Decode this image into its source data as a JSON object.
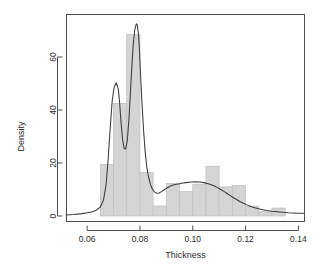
{
  "chart_data": {
    "type": "bar",
    "title": "",
    "subtitle": "",
    "xlabel": "Thickness",
    "ylabel": "Density",
    "xlim": [
      0.052,
      0.1425
    ],
    "ylim": [
      -1,
      75
    ],
    "grid": false,
    "legend": "none",
    "xticks": [
      0.06,
      0.08,
      0.1,
      0.12,
      0.14
    ],
    "xtick_labels": [
      "0.06",
      "0.08",
      "0.10",
      "0.12",
      "0.14"
    ],
    "yticks": [
      0,
      20,
      40,
      60
    ],
    "ytick_labels": [
      "0",
      "20",
      "40",
      "60"
    ],
    "bin_width": 0.005,
    "bin_edges": [
      0.065,
      0.07,
      0.075,
      0.08,
      0.085,
      0.09,
      0.095,
      0.1,
      0.105,
      0.11,
      0.115,
      0.12,
      0.125,
      0.13,
      0.135
    ],
    "categories": [
      "0.065-0.070",
      "0.070-0.075",
      "0.075-0.080",
      "0.080-0.085",
      "0.085-0.090",
      "0.090-0.095",
      "0.095-0.100",
      "0.100-0.105",
      "0.105-0.110",
      "0.110-0.115",
      "0.115-0.120",
      "0.120-0.125",
      "0.125-0.130",
      "0.130-0.135"
    ],
    "values": [
      19.5,
      42.5,
      68.5,
      16.5,
      3.8,
      12.3,
      9.2,
      12.0,
      18.8,
      11.0,
      11.5,
      3.7,
      1.6,
      3.0
    ],
    "series": [
      {
        "name": "Histogram (Density)",
        "type": "bar",
        "fill_color": "#d4d4d4",
        "edge_color": "#bfbfbf",
        "values": [
          19.5,
          42.5,
          68.5,
          16.5,
          3.8,
          12.3,
          9.2,
          12.0,
          18.8,
          11.0,
          11.5,
          3.7,
          1.6,
          3.0
        ]
      },
      {
        "name": "Kernel Density Estimate",
        "type": "line",
        "line_color": "#3a3a3a",
        "x": [
          0.052,
          0.055,
          0.058,
          0.06,
          0.062,
          0.0635,
          0.065,
          0.0662,
          0.0672,
          0.068,
          0.0688,
          0.0695,
          0.0702,
          0.071,
          0.0718,
          0.0722,
          0.0728,
          0.0734,
          0.074,
          0.0746,
          0.0752,
          0.0758,
          0.0762,
          0.0768,
          0.0774,
          0.078,
          0.0786,
          0.079,
          0.0794,
          0.0798,
          0.0802,
          0.0808,
          0.0814,
          0.082,
          0.0826,
          0.0832,
          0.084,
          0.0848,
          0.0856,
          0.0864,
          0.0872,
          0.0882,
          0.0892,
          0.0902,
          0.0914,
          0.0926,
          0.0938,
          0.095,
          0.0962,
          0.0974,
          0.0986,
          0.0998,
          0.101,
          0.1022,
          0.1034,
          0.1046,
          0.1058,
          0.107,
          0.1082,
          0.1094,
          0.1106,
          0.1118,
          0.113,
          0.1142,
          0.1154,
          0.1166,
          0.1178,
          0.119,
          0.1205,
          0.122,
          0.1235,
          0.125,
          0.1265,
          0.128,
          0.13,
          0.132,
          0.134,
          0.136,
          0.138,
          0.14,
          0.142
        ],
        "y": [
          0.4,
          0.6,
          0.9,
          1.2,
          1.6,
          2.2,
          3.4,
          6.0,
          12.0,
          22.0,
          34.0,
          43.5,
          48.5,
          50.3,
          48.0,
          44.0,
          36.0,
          29.0,
          25.5,
          25.3,
          28.5,
          36.0,
          43.0,
          54.0,
          64.0,
          70.0,
          72.5,
          72.0,
          69.0,
          63.0,
          54.0,
          42.0,
          32.0,
          24.0,
          18.5,
          15.0,
          11.8,
          10.0,
          9.0,
          8.6,
          8.7,
          9.2,
          9.9,
          10.6,
          11.2,
          11.7,
          12.0,
          12.2,
          12.45,
          12.6,
          12.75,
          12.85,
          12.9,
          12.85,
          12.7,
          12.5,
          12.2,
          11.8,
          11.3,
          10.7,
          10.0,
          9.3,
          8.5,
          7.7,
          6.9,
          6.2,
          5.5,
          4.9,
          4.2,
          3.6,
          3.1,
          2.7,
          2.4,
          2.1,
          1.8,
          1.6,
          1.4,
          1.25,
          1.15,
          1.05,
          1.0
        ]
      }
    ]
  },
  "plot": {
    "axis_color": "#4d4d4d",
    "bar_fill": "#d4d4d4",
    "bar_edge": "#c2c2c2",
    "curve_color": "#3a3a3a",
    "background": "#ffffff"
  }
}
